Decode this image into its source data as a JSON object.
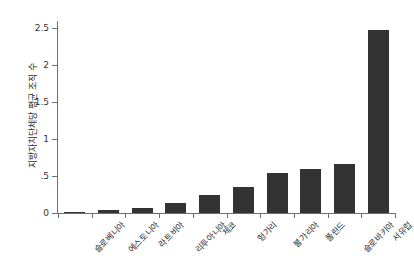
{
  "chart_data": {
    "type": "bar",
    "title": "중동부 유럽의 지방자치단체당 평균 조직 수",
    "xlabel": "",
    "ylabel": "지방자치단체당 평균 조직 수",
    "ylim": [
      0,
      2.6
    ],
    "grid": false,
    "legend": null,
    "bar_color": "#333333",
    "categories": [
      "슬로베니아",
      "에스토니아",
      "라트비아",
      "리투아니아",
      "체코",
      "헝가리",
      "불가리아",
      "폴란드",
      "슬로바키아",
      "서유럽"
    ],
    "values": [
      0.02,
      0.04,
      0.07,
      0.13,
      0.25,
      0.35,
      0.54,
      0.6,
      0.67,
      2.48
    ],
    "yticks": [
      {
        "value": 0,
        "label": "0"
      },
      {
        "value": 0.5,
        "label": ".5"
      },
      {
        "value": 1,
        "label": "1"
      },
      {
        "value": 1.5,
        "label": "1.5"
      },
      {
        "value": 2,
        "label": "2"
      },
      {
        "value": 2.5,
        "label": "2.5"
      }
    ]
  },
  "axes": {
    "y_title": "지방자치단체당 평균 조직 수"
  }
}
